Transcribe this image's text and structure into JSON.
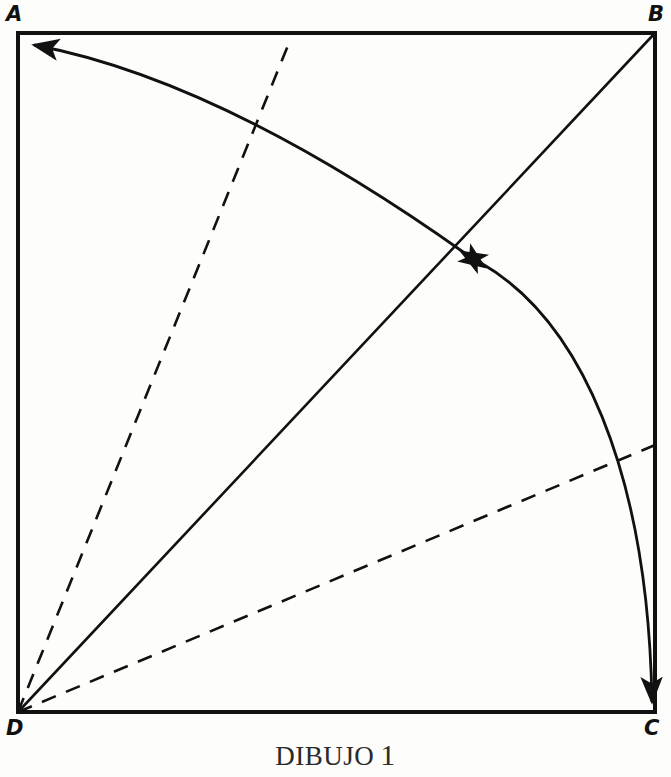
{
  "figure": {
    "caption_text": "DIBUJO",
    "caption_number": "1",
    "background_color": "#fdfdfb",
    "ink_color": "#111111"
  },
  "vertices": [
    {
      "id": "A",
      "label": "A",
      "x": 18,
      "y": 33,
      "corner": "top-left"
    },
    {
      "id": "B",
      "label": "B",
      "x": 655,
      "y": 33,
      "corner": "top-right"
    },
    {
      "id": "C",
      "label": "C",
      "x": 655,
      "y": 712,
      "corner": "bottom-right"
    },
    {
      "id": "D",
      "label": "D",
      "x": 18,
      "y": 712,
      "corner": "bottom-left"
    }
  ],
  "shape": {
    "name": "square-ABCD",
    "sides": [
      {
        "name": "side-AB",
        "from": "A",
        "to": "B",
        "style": "solid"
      },
      {
        "name": "side-BC",
        "from": "B",
        "to": "C",
        "style": "solid"
      },
      {
        "name": "side-CD",
        "from": "C",
        "to": "D",
        "style": "solid"
      },
      {
        "name": "side-DA",
        "from": "D",
        "to": "A",
        "style": "solid"
      }
    ]
  },
  "lines": [
    {
      "name": "diagonal-DB",
      "style": "solid",
      "from": "D",
      "to": "B",
      "x1": 18,
      "y1": 712,
      "x2": 655,
      "y2": 33
    },
    {
      "name": "dashed-ray-steep",
      "style": "dashed",
      "from": "D",
      "to": "top-edge",
      "x1": 18,
      "y1": 712,
      "x2": 291,
      "y2": 38
    },
    {
      "name": "dashed-ray-shallow",
      "style": "dashed",
      "from": "D",
      "to": "right-edge",
      "x1": 18,
      "y1": 712,
      "x2": 655,
      "y2": 445
    }
  ],
  "arrows": [
    {
      "name": "arc-center-to-A",
      "style": "curved-arrow",
      "start": {
        "x": 465,
        "y": 253
      },
      "end": {
        "x": 32,
        "y": 45
      },
      "control": {
        "x": 250,
        "y": 70
      },
      "arrowhead_at": [
        "end",
        "start"
      ],
      "description": "double-headed arc from diagonal midpoint to vertex A"
    },
    {
      "name": "arc-center-to-C",
      "style": "curved-arrow",
      "start": {
        "x": 481,
        "y": 262
      },
      "end": {
        "x": 653,
        "y": 706
      },
      "control": {
        "x": 648,
        "y": 420
      },
      "arrowhead_at": [
        "start",
        "end"
      ],
      "description": "double-headed arc from diagonal midpoint to vertex C"
    }
  ]
}
